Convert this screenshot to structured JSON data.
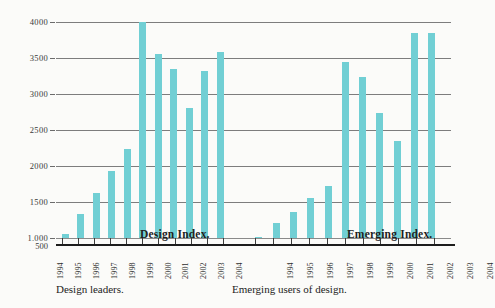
{
  "chart_data": {
    "type": "bar",
    "title": "",
    "xlabel": "",
    "ylabel": "",
    "ylim": [
      500,
      4000
    ],
    "ytick_labels": [
      "4000",
      "3500",
      "3000",
      "2500",
      "2000",
      "1500",
      "1.000",
      "500"
    ],
    "ytick_values": [
      4000,
      3500,
      3000,
      2500,
      2000,
      1500,
      1000,
      500
    ],
    "grid": true,
    "legend": "none",
    "bar_color": "#71cfd4",
    "baseline": 1000,
    "categories": [
      "1994",
      "1995",
      "1996",
      "1997",
      "1998",
      "1999",
      "2000",
      "2001",
      "2002",
      "2003",
      "2004"
    ],
    "series": [
      {
        "name": "Design Index.",
        "caption": "Design leaders.",
        "values": [
          1050,
          1340,
          1620,
          1930,
          2230,
          4000,
          3550,
          3350,
          2800,
          3320,
          3580
        ]
      },
      {
        "name": "Emerging Index.",
        "caption": "Emerging users of design.",
        "values": [
          1020,
          1210,
          1360,
          1550,
          1720,
          3440,
          3230,
          2740,
          2350,
          3850,
          3850
        ]
      }
    ]
  },
  "axis": {
    "bottom_tick_label": "500"
  }
}
